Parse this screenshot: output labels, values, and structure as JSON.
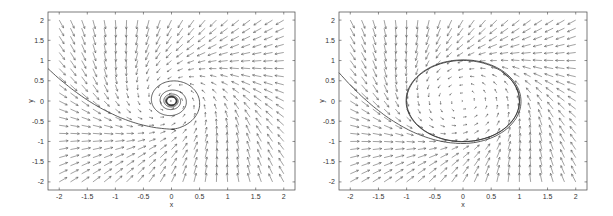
{
  "chart_data": [
    {
      "type": "quiver",
      "title": "",
      "xlabel": "x",
      "ylabel": "y",
      "xlim": [
        -2.2,
        2.2
      ],
      "ylim": [
        -2.2,
        2.2
      ],
      "xticks": [
        "-2",
        "-1.5",
        "-1",
        "-0.5",
        "0",
        "0.5",
        "1",
        "1.5",
        "2"
      ],
      "yticks": [
        "2",
        "1.5",
        "1",
        "0.5",
        "0",
        "-0.5",
        "-1",
        "-1.5",
        "-2"
      ],
      "grid": false,
      "vector_grid": {
        "x_from": -2,
        "x_to": 2,
        "y_from": -2,
        "y_to": 2,
        "n": 21
      },
      "trajectory": "spiral from (-2.2, 0.8) converging to small limit cycle near origin (radius ~0.1)",
      "limit_cycle_radius": 0.1
    },
    {
      "type": "quiver",
      "title": "",
      "xlabel": "x",
      "ylabel": "y",
      "xlim": [
        -2.2,
        2.2
      ],
      "ylim": [
        -2.2,
        2.2
      ],
      "xticks": [
        "-2",
        "-1.5",
        "-1",
        "-0.5",
        "0",
        "0.5",
        "1",
        "1.5",
        "2"
      ],
      "yticks": [
        "2",
        "1.5",
        "1",
        "0.5",
        "0",
        "-0.5",
        "-1",
        "-1.5",
        "-2"
      ],
      "grid": false,
      "vector_grid": {
        "x_from": -2,
        "x_to": 2,
        "y_from": -2,
        "y_to": 2,
        "n": 21
      },
      "trajectory": "spiral from (-2.2, 0.7) converging to limit cycle of radius ~1",
      "limit_cycle_radius": 1.0
    }
  ],
  "plots": [
    {
      "xlabel": "x",
      "ylabel": "y",
      "frame": {
        "x": 48,
        "y": 12,
        "w": 247,
        "h": 178
      }
    },
    {
      "xlabel": "x",
      "ylabel": "y",
      "frame": {
        "x": 339,
        "y": 12,
        "w": 248,
        "h": 178
      }
    }
  ],
  "colors": {
    "axis": "#444444",
    "arrow": "#555555",
    "curve": "#333333"
  }
}
